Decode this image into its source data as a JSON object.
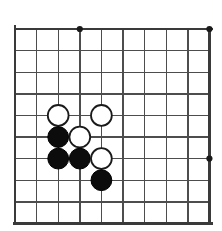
{
  "figure": {
    "kind": "go-board-diagram",
    "background_color": "#ffffff"
  },
  "board": {
    "visible_columns": 10,
    "visible_rows": 10,
    "origin_x": 15,
    "origin_y": 29,
    "cell_size": 21.6,
    "line_color": "#4d4d4d",
    "edge_color": "#3a3a3a",
    "line_width": 1.4,
    "edge_width": 2.6,
    "edges": [
      "left",
      "top",
      "bottom",
      "right"
    ],
    "star_point_radius": 3.1,
    "star_point_color": "#1a1a1a",
    "star_points": [
      {
        "col": 3,
        "row": 0
      },
      {
        "col": 9,
        "row": 0
      },
      {
        "col": 9,
        "row": 6
      }
    ]
  },
  "stones": {
    "radius": 10.4,
    "black_fill": "#0c0c0c",
    "white_fill": "#ffffff",
    "white_stroke": "#1a1a1a",
    "items": [
      {
        "color": "white",
        "col": 2,
        "row": 4
      },
      {
        "color": "white",
        "col": 4,
        "row": 4
      },
      {
        "color": "black",
        "col": 2,
        "row": 5
      },
      {
        "color": "white",
        "col": 3,
        "row": 5
      },
      {
        "color": "black",
        "col": 2,
        "row": 6
      },
      {
        "color": "black",
        "col": 3,
        "row": 6
      },
      {
        "color": "white",
        "col": 4,
        "row": 6
      },
      {
        "color": "black",
        "col": 4,
        "row": 7
      }
    ]
  }
}
